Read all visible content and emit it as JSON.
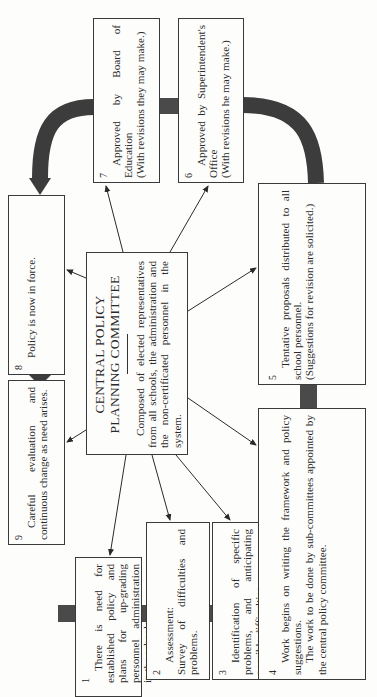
{
  "diagram": {
    "orientation": "rotated-90-ccw",
    "center": {
      "title_line1": "CENTRAL POLICY",
      "title_line2": "PLANNING COMMITTEE",
      "description": "Composed of elected representatives from all schools, the administration and the non-certificated personnel in the system."
    },
    "steps": [
      {
        "number": "1",
        "text": "There is need for established policy and plans for up-grading personnel administration in the schools."
      },
      {
        "number": "2",
        "title": "Assessment:",
        "text": "Survey of difficulties and problems."
      },
      {
        "number": "3",
        "text": "Identification of specific problems, and anticipating possible difficulties."
      },
      {
        "number": "4",
        "text": "Work begins on writing the framework and policy suggestions.",
        "text2": "The work to be done by sub-committees appointed by the central policy committee."
      },
      {
        "number": "5",
        "text": "Tentative proposals distributed to all school personnel.",
        "text2": "(Suggestions for revision are solicited.)"
      },
      {
        "number": "6",
        "text": "Approved by Superintendent's Office",
        "text2": "(With revisions he may make.)"
      },
      {
        "number": "7",
        "text": "Approved by Board of Education",
        "text2": "(With revisions they may make.)"
      },
      {
        "number": "8",
        "text": "Policy is now in force."
      },
      {
        "number": "9",
        "text": "Careful evaluation and continuous change as need arises."
      }
    ],
    "colors": {
      "background": "#fdfdfb",
      "line": "#2a2a2a",
      "flow_arrow": "#3c3c3c"
    }
  }
}
